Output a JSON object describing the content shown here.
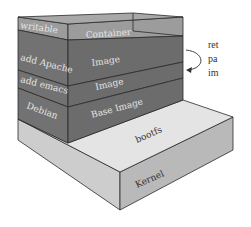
{
  "diagram": {
    "layers_left": [
      {
        "label": "writable"
      },
      {
        "label": "add Apache"
      },
      {
        "label": "add emacs"
      },
      {
        "label": "Debian"
      }
    ],
    "layers_front": [
      {
        "label": "Container"
      },
      {
        "label": "Image"
      },
      {
        "label": "Image"
      },
      {
        "label": "Base Image"
      }
    ],
    "base": {
      "bootfs_label": "bootfs",
      "kernel_label": "Kernel"
    },
    "annotation": {
      "lines": [
        "ret",
        "pa",
        "im"
      ]
    },
    "colors": {
      "writable_layer": "#9a9a9a",
      "image_layer": "#6e6e6e",
      "bootfs_top": "#e6e6e6",
      "kernel_side": "#bdbdbd",
      "kernel_left": "#cfcfcf",
      "edge": "#2a2a2a"
    }
  }
}
